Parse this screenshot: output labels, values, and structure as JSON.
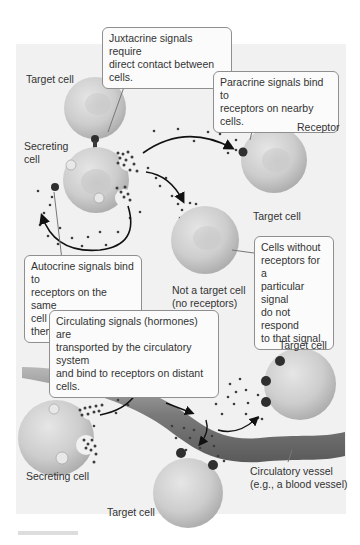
{
  "diagram": {
    "callouts": {
      "juxtacrine": [
        "Juxtacrine signals require",
        "direct contact between cells."
      ],
      "paracrine": [
        "Paracrine signals bind to",
        "receptors on nearby cells."
      ],
      "autocrine": [
        "Autocrine signals bind to",
        "receptors on the same",
        "cell that secretes them."
      ],
      "no_receptor": [
        "Cells without",
        "receptors for a",
        "particular signal",
        "do not respond",
        "to that signal."
      ],
      "circulating": [
        "Circulating signals (hormones) are",
        "transported by the circulatory system",
        "and bind to receptors on distant cells."
      ]
    },
    "labels": {
      "target_cell_top": "Target cell",
      "secreting_cell_top": [
        "Secreting",
        "cell"
      ],
      "receptor": "Receptor",
      "target_cell_right": "Target cell",
      "not_target": [
        "Not a target cell",
        "(no receptors)"
      ],
      "target_cell_far": "Target cell",
      "secreting_cell_bottom": "Secreting cell",
      "target_cell_bottom": "Target cell",
      "vessel": [
        "Circulatory vessel",
        "(e.g., a blood vessel)"
      ]
    },
    "colors": {
      "panel": "#f1f1f1",
      "cell": "#cfcfcf",
      "receptor": "#3a3a3a",
      "signal": "#444444",
      "vessel": "#8a8a8a"
    }
  }
}
